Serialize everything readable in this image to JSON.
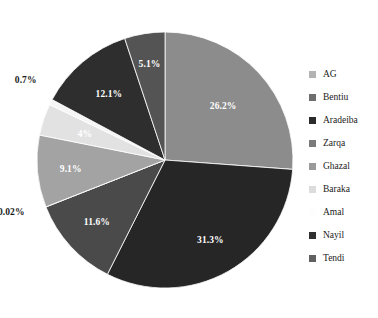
{
  "chart_data": {
    "type": "pie",
    "title": "",
    "subtitle": "",
    "xlabel": "",
    "ylabel": "",
    "grid": false,
    "legend_position": "right",
    "start_angle_deg": 0,
    "direction": "clockwise",
    "categories": [
      "AG",
      "Bentiu",
      "Aradeiba",
      "Zarqa",
      "Ghazal",
      "Baraka",
      "Amal",
      "Nayil",
      "Tendi"
    ],
    "values": [
      26.2,
      31.3,
      11.6,
      0.02,
      9.1,
      4,
      0.7,
      12.1,
      5.1
    ],
    "value_labels": [
      "26.2%",
      "31.3%",
      "11.6%",
      "0.02%",
      "9.1%",
      "4%",
      "0.7%",
      "12.1%",
      "5.1%"
    ],
    "colors": [
      "#8c8c8c",
      "#262626",
      "#4a4a4a",
      "#595959",
      "#a3a3a3",
      "#e2e2e2",
      "#f5f5f5",
      "#2e2e2e",
      "#545454"
    ],
    "slices": [
      {
        "name": "AG",
        "value": 26.2,
        "label": "26.2%",
        "color": "#8c8c8c",
        "label_placement": "inside"
      },
      {
        "name": "Bentiu",
        "value": 31.3,
        "label": "31.3%",
        "color": "#262626",
        "label_placement": "inside"
      },
      {
        "name": "Aradeiba",
        "value": 11.6,
        "label": "11.6%",
        "color": "#4a4a4a",
        "label_placement": "inside"
      },
      {
        "name": "Zarqa",
        "value": 0.02,
        "label": "0.02%",
        "color": "#595959",
        "label_placement": "outside"
      },
      {
        "name": "Ghazal",
        "value": 9.1,
        "label": "9.1%",
        "color": "#a3a3a3",
        "label_placement": "inside"
      },
      {
        "name": "Baraka",
        "value": 4,
        "label": "4%",
        "color": "#e2e2e2",
        "label_placement": "inside"
      },
      {
        "name": "Amal",
        "value": 0.7,
        "label": "0.7%",
        "color": "#f5f5f5",
        "label_placement": "outside"
      },
      {
        "name": "Nayil",
        "value": 12.1,
        "label": "12.1%",
        "color": "#2e2e2e",
        "label_placement": "inside"
      },
      {
        "name": "Tendi",
        "value": 5.1,
        "label": "5.1%",
        "color": "#545454",
        "label_placement": "inside"
      }
    ]
  },
  "legend": {
    "items": [
      {
        "label": "AG",
        "color": "#b3b3b3"
      },
      {
        "label": "Bentiu",
        "color": "#6e6e6e"
      },
      {
        "label": "Aradeiba",
        "color": "#2b2b2b"
      },
      {
        "label": "Zarqa",
        "color": "#7a7a7a"
      },
      {
        "label": "Ghazal",
        "color": "#9a9a9a"
      },
      {
        "label": "Baraka",
        "color": "#dcdcdc"
      },
      {
        "label": "Amal",
        "color": "#fdfdfd"
      },
      {
        "label": "Nayil",
        "color": "#303030"
      },
      {
        "label": "Tendi",
        "color": "#606060"
      }
    ]
  }
}
